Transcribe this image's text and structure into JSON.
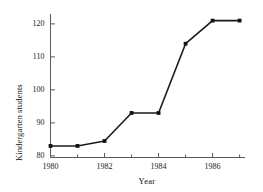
{
  "chart_data": {
    "type": "line",
    "title": "",
    "xlabel": "Year",
    "ylabel": "Kindergarten students",
    "x": [
      1980,
      1981,
      1982,
      1983,
      1984,
      1985,
      1986,
      1987
    ],
    "values": [
      83,
      83,
      84.5,
      93,
      93,
      114,
      121,
      121
    ],
    "series": [
      {
        "name": "Kindergarten students",
        "values": [
          83,
          83,
          84.5,
          93,
          93,
          114,
          121,
          121
        ]
      }
    ],
    "xlim": [
      1980,
      1987.2
    ],
    "ylim": [
      79.5,
      123
    ],
    "x_major_ticks": [
      1980,
      1982,
      1984,
      1986
    ],
    "x_major_tick_labels": [
      "1980",
      "1982",
      "1984",
      "1986"
    ],
    "x_minor_ticks": [
      1981,
      1983,
      1985,
      1987
    ],
    "y_ticks": [
      80,
      90,
      100,
      110,
      120
    ],
    "y_tick_labels": [
      "80",
      "90",
      "100",
      "110",
      "120"
    ],
    "grid": false,
    "legend": "none",
    "marker": "square",
    "line_color": "#1a1a1a",
    "marker_color": "#111111",
    "axis_color": "#5a5a5a",
    "background_color": "#ffffff"
  }
}
